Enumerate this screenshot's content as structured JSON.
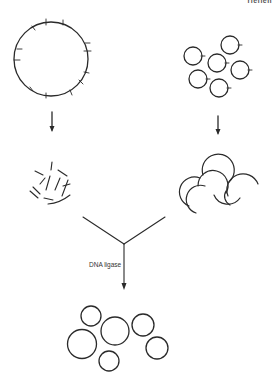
{
  "header_fragment": "rieflen",
  "diagram": {
    "stroke_color": "#2a2a2a",
    "ligase_label": "DNA ligase",
    "left_branch": {
      "start": "large circular DNA with cut sites",
      "tick_count": 12,
      "result": "linear fragments"
    },
    "right_branch": {
      "start": "six small plasmid circles with cut site",
      "plasmid_count": 6,
      "result": "opened/cut plasmid arcs"
    },
    "final": {
      "description": "recombinant circular DNA molecules",
      "circle_count": 6
    }
  }
}
